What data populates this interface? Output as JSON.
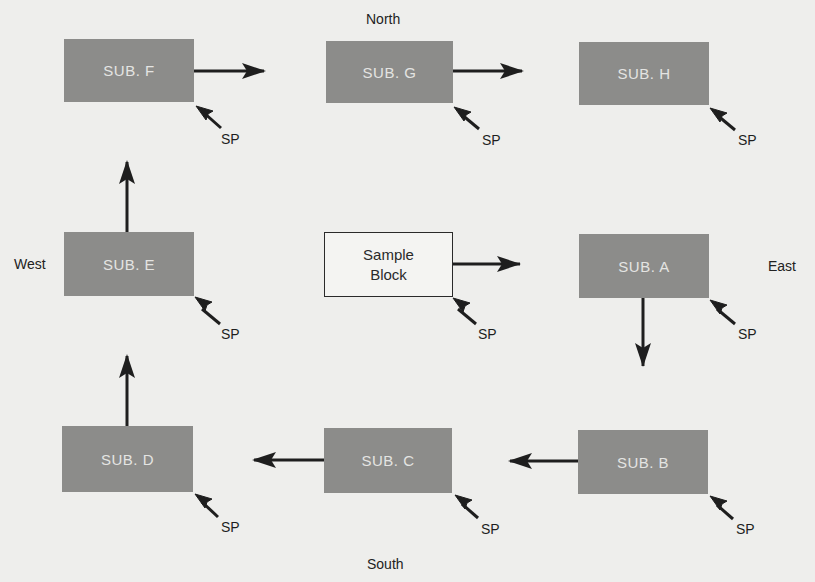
{
  "diagram": {
    "compass": {
      "north": "North",
      "south": "South",
      "east": "East",
      "west": "West"
    },
    "sample_block": {
      "line1": "Sample",
      "line2": "Block",
      "sp": "SP"
    },
    "subs": [
      {
        "id": "A",
        "label": "SUB. A",
        "sp": "SP"
      },
      {
        "id": "B",
        "label": "SUB. B",
        "sp": "SP"
      },
      {
        "id": "C",
        "label": "SUB. C",
        "sp": "SP"
      },
      {
        "id": "D",
        "label": "SUB. D",
        "sp": "SP"
      },
      {
        "id": "E",
        "label": "SUB. E",
        "sp": "SP"
      },
      {
        "id": "F",
        "label": "SUB. F",
        "sp": "SP"
      },
      {
        "id": "G",
        "label": "SUB. G",
        "sp": "SP"
      },
      {
        "id": "H",
        "label": "SUB. H",
        "sp": "SP"
      }
    ],
    "flow": [
      "Sample Block",
      "SUB. A",
      "SUB. B",
      "SUB. C",
      "SUB. D",
      "SUB. E",
      "SUB. F",
      "SUB. G",
      "SUB. H"
    ],
    "colors": {
      "background": "#eeeeec",
      "sub_fill": "#8c8c8a",
      "sub_text": "#e4e4e2",
      "arrow": "#1e1e1e"
    }
  }
}
